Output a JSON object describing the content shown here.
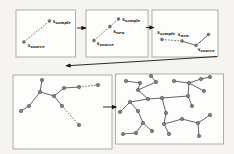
{
  "figure": {
    "width": 234,
    "height": 154,
    "colors": {
      "background": "#f5f4f1",
      "panel_fill": "#fdfdfc",
      "panel_border": "#9b9a96",
      "node_fill": "#828282",
      "node_stroke": "#3f3f3f",
      "edge_solid": "#3d3d3d",
      "edge_dashed": "#4a4a4a",
      "arrow": "#141414",
      "label": "#161616"
    }
  },
  "panels": [
    {
      "name": "step-1",
      "box": [
        16,
        10,
        59.5,
        47
      ]
    },
    {
      "name": "step-2",
      "box": [
        86,
        10,
        62,
        47
      ]
    },
    {
      "name": "step-3",
      "box": [
        152,
        10,
        66,
        47
      ]
    },
    {
      "name": "tree-before",
      "box": [
        13,
        75,
        99,
        74
      ]
    },
    {
      "name": "tree-after",
      "box": [
        115.5,
        74,
        108,
        70
      ]
    }
  ],
  "steps": [
    {
      "points": [
        {
          "id": "x_source",
          "x": 24,
          "y": 42
        },
        {
          "id": "x_sample",
          "x": 49.5,
          "y": 21
        }
      ],
      "segments": [
        {
          "x1": 24,
          "y1": 42,
          "x2": 49.5,
          "y2": 21,
          "style": "dashed"
        }
      ],
      "labels": [
        {
          "main": "x",
          "sub": "source",
          "x": 27.5,
          "y": 46.5
        },
        {
          "main": "x",
          "sub": "sample",
          "x": 52.5,
          "y": 22.5
        }
      ]
    },
    {
      "points": [
        {
          "id": "x_source",
          "x": 94,
          "y": 40.5
        },
        {
          "id": "x_new",
          "x": 110,
          "y": 26.5
        },
        {
          "id": "x_sample",
          "x": 118.5,
          "y": 19
        }
      ],
      "segments": [
        {
          "x1": 94,
          "y1": 40.5,
          "x2": 110,
          "y2": 26.5,
          "style": "dashed"
        },
        {
          "x1": 110,
          "y1": 26.5,
          "x2": 118.5,
          "y2": 19,
          "style": "dashed"
        }
      ],
      "labels": [
        {
          "main": "x",
          "sub": "source",
          "x": 96.5,
          "y": 44.5
        },
        {
          "main": "x",
          "sub": "new",
          "x": 113,
          "y": 32.5
        },
        {
          "main": "x",
          "sub": "sample",
          "x": 122,
          "y": 20.5
        }
      ]
    },
    {
      "points": [
        {
          "id": "x_sample",
          "x": 162,
          "y": 39.5
        },
        {
          "id": "x_new",
          "x": 182,
          "y": 41
        },
        {
          "id": "x_source",
          "x": 196,
          "y": 45.5
        },
        {
          "id": "tree-point",
          "x": 208.5,
          "y": 34.5
        }
      ],
      "segments": [
        {
          "x1": 162,
          "y1": 39.5,
          "x2": 182,
          "y2": 41,
          "style": "dashed"
        },
        {
          "x1": 182,
          "y1": 41,
          "x2": 196,
          "y2": 45.5,
          "style": "solid"
        },
        {
          "x1": 196,
          "y1": 45.5,
          "x2": 208.5,
          "y2": 34.5,
          "style": "solid"
        }
      ],
      "labels": [
        {
          "main": "x",
          "sub": "sample",
          "x": 157,
          "y": 33.5
        },
        {
          "main": "x",
          "sub": "new",
          "x": 177.5,
          "y": 35.5
        },
        {
          "main": "x",
          "sub": "source",
          "x": 197.5,
          "y": 50.5
        }
      ]
    }
  ],
  "trees": [
    {
      "name": "tree-before",
      "nodes": [
        [
          42,
          80
        ],
        [
          40,
          92
        ],
        [
          29,
          106
        ],
        [
          21,
          111
        ],
        [
          54,
          96
        ],
        [
          64,
          88
        ],
        [
          79,
          87
        ],
        [
          98,
          85
        ],
        [
          62,
          106
        ],
        [
          79,
          125
        ]
      ],
      "edges": [
        [
          0,
          1,
          "solid"
        ],
        [
          1,
          2,
          "solid"
        ],
        [
          2,
          3,
          "solid"
        ],
        [
          1,
          4,
          "solid"
        ],
        [
          4,
          5,
          "solid"
        ],
        [
          5,
          6,
          "solid"
        ],
        [
          6,
          7,
          "dashed"
        ],
        [
          4,
          8,
          "solid"
        ],
        [
          8,
          9,
          "dashed"
        ]
      ]
    },
    {
      "name": "tree-after",
      "nodes": [
        [
          151,
          76
        ],
        [
          156,
          82
        ],
        [
          140,
          83
        ],
        [
          126,
          81
        ],
        [
          138,
          90
        ],
        [
          148,
          99
        ],
        [
          130,
          102
        ],
        [
          120,
          112
        ],
        [
          123,
          134
        ],
        [
          138,
          111
        ],
        [
          143,
          123
        ],
        [
          152,
          131
        ],
        [
          136,
          133
        ],
        [
          162,
          98
        ],
        [
          166,
          113
        ],
        [
          164,
          124
        ],
        [
          169,
          134
        ],
        [
          182,
          119
        ],
        [
          198,
          123
        ],
        [
          210,
          115
        ],
        [
          199,
          136
        ],
        [
          174,
          81
        ],
        [
          189,
          83
        ],
        [
          201,
          79
        ],
        [
          210,
          77
        ],
        [
          204,
          91
        ],
        [
          188,
          96
        ],
        [
          192,
          106
        ]
      ],
      "edges": [
        [
          0,
          1,
          "solid"
        ],
        [
          1,
          4,
          "solid"
        ],
        [
          2,
          4,
          "solid"
        ],
        [
          2,
          3,
          "solid"
        ],
        [
          4,
          5,
          "solid"
        ],
        [
          5,
          13,
          "solid"
        ],
        [
          5,
          6,
          "solid"
        ],
        [
          6,
          7,
          "solid"
        ],
        [
          6,
          9,
          "solid"
        ],
        [
          9,
          10,
          "solid"
        ],
        [
          10,
          11,
          "solid"
        ],
        [
          10,
          12,
          "solid"
        ],
        [
          12,
          8,
          "solid"
        ],
        [
          13,
          26,
          "solid"
        ],
        [
          13,
          14,
          "solid"
        ],
        [
          14,
          15,
          "solid"
        ],
        [
          15,
          16,
          "solid"
        ],
        [
          15,
          17,
          "solid"
        ],
        [
          17,
          18,
          "solid"
        ],
        [
          18,
          19,
          "solid"
        ],
        [
          18,
          20,
          "solid"
        ],
        [
          26,
          27,
          "solid"
        ],
        [
          26,
          22,
          "solid"
        ],
        [
          22,
          21,
          "solid"
        ],
        [
          22,
          23,
          "solid"
        ],
        [
          23,
          24,
          "solid"
        ],
        [
          22,
          25,
          "solid"
        ]
      ]
    }
  ],
  "arrows": [
    {
      "name": "arrow-step1-step2",
      "type": "line",
      "x1": 77,
      "y1": 28,
      "x2": 86,
      "y2": 28
    },
    {
      "name": "arrow-step2-step3",
      "type": "line",
      "x1": 146,
      "y1": 27.5,
      "x2": 154,
      "y2": 27.5
    },
    {
      "name": "arrow-restart-loop",
      "type": "path",
      "d": "M 217 56.5 Q 140 61.5 66 65.8"
    },
    {
      "name": "arrow-tree-growth",
      "type": "line",
      "x1": 103,
      "y1": 107,
      "x2": 116.5,
      "y2": 107
    }
  ]
}
